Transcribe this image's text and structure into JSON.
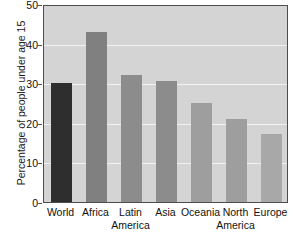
{
  "chart_data": {
    "type": "bar",
    "title": "",
    "xlabel": "",
    "ylabel": "Percentage of people under age 15",
    "categories": [
      "World",
      "Africa",
      "Latin America",
      "Asia",
      "Oceania",
      "North America",
      "Europe"
    ],
    "category_lines": [
      [
        "World",
        ""
      ],
      [
        "Africa",
        ""
      ],
      [
        "Latin",
        "America"
      ],
      [
        "Asia",
        ""
      ],
      [
        "Oceania",
        ""
      ],
      [
        "North",
        "America"
      ],
      [
        "Europe",
        ""
      ]
    ],
    "values": [
      30,
      43,
      32,
      30.5,
      25,
      21,
      17.3
    ],
    "bar_colors": [
      "#2e2e2e",
      "#808080",
      "#8c8c8c",
      "#8c8c8c",
      "#9e9e9e",
      "#9e9e9e",
      "#a8a8a8"
    ],
    "ylim": [
      0,
      50
    ],
    "yticks": [
      0,
      10,
      20,
      30,
      40,
      50
    ],
    "ytick_labels": [
      "0",
      "10",
      "20",
      "30",
      "40",
      "50"
    ],
    "grid": true,
    "grid_color": "#f2f2f2",
    "plot_background": "#d4d4d4",
    "frame_color": "#4d4d4d",
    "legend": null
  }
}
